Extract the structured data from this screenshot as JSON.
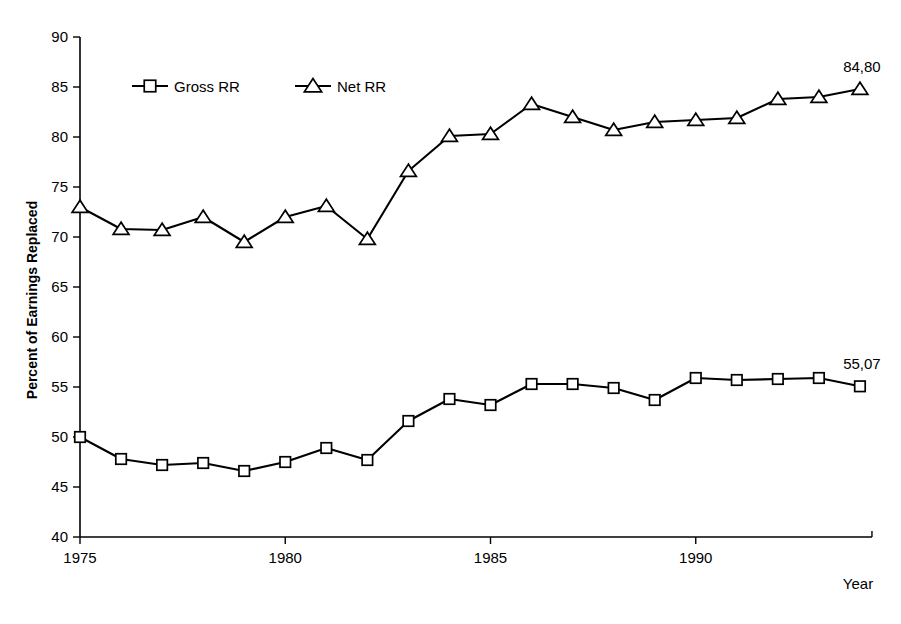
{
  "chart_data": {
    "type": "line",
    "title": "",
    "xlabel": "Year",
    "ylabel": "Percent of Earnings Replaced",
    "xlim": [
      1975,
      1994
    ],
    "ylim": [
      40,
      90
    ],
    "ytick_step": 5,
    "grid": false,
    "legend_position": "top-left-inside",
    "x": [
      1975,
      1976,
      1977,
      1978,
      1979,
      1980,
      1981,
      1982,
      1983,
      1984,
      1985,
      1986,
      1987,
      1988,
      1989,
      1990,
      1991,
      1992,
      1993,
      1994
    ],
    "xticks": [
      1975,
      1980,
      1985,
      1990
    ],
    "xtick_labels": [
      "1975",
      "1980",
      "1985",
      "1990"
    ],
    "yticks": [
      40,
      45,
      50,
      55,
      60,
      65,
      70,
      75,
      80,
      85,
      90
    ],
    "ytick_labels": [
      "40",
      "45",
      "50",
      "55",
      "60",
      "65",
      "70",
      "75",
      "80",
      "85",
      "90"
    ],
    "series": [
      {
        "name": "Gross RR",
        "marker": "square",
        "values": [
          50.0,
          47.8,
          47.2,
          47.4,
          46.6,
          47.5,
          48.9,
          47.7,
          51.6,
          53.8,
          53.2,
          55.3,
          55.3,
          54.9,
          53.7,
          55.9,
          55.7,
          55.8,
          55.9,
          55.07
        ],
        "end_label": "55,07"
      },
      {
        "name": "Net RR",
        "marker": "triangle",
        "values": [
          73.0,
          70.8,
          70.7,
          72.0,
          69.5,
          72.0,
          73.1,
          69.8,
          76.6,
          80.1,
          80.3,
          83.3,
          82.0,
          80.7,
          81.5,
          81.7,
          81.9,
          83.8,
          84.0,
          84.8
        ],
        "end_label": "84,80"
      }
    ],
    "annotations": [
      {
        "text": "84,80",
        "series": "Net RR",
        "x": 1994,
        "y": 84.8
      },
      {
        "text": "55,07",
        "series": "Gross RR",
        "x": 1994,
        "y": 55.07
      }
    ]
  },
  "legend": {
    "items": [
      {
        "label": "Gross RR",
        "marker": "square"
      },
      {
        "label": "Net RR",
        "marker": "triangle"
      }
    ]
  }
}
